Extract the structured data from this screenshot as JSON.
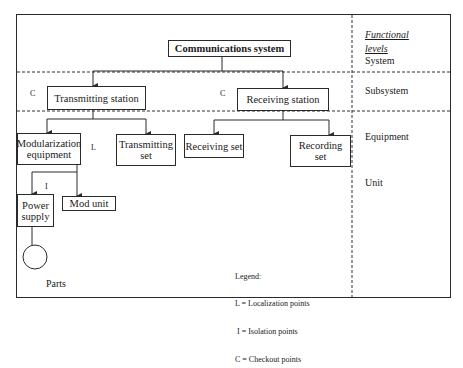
{
  "diagram": {
    "title": "Communications system",
    "levels_header": [
      "Functional",
      "levels"
    ],
    "levels": [
      "System",
      "Subsystem",
      "Equipment",
      "Unit"
    ],
    "nodes": {
      "system": "Communications system",
      "transmitting_station": "Transmitting station",
      "receiving_station": "Receiving station",
      "modularization_equipment": "Modularization equipment",
      "transmitting_set": "Transmitting set",
      "receiving_set": "Receiving set",
      "recording_set": "Recording set",
      "power_supply": "Power supply",
      "mod_unit": "Mod unit",
      "parts": "Parts"
    },
    "markers": {
      "transmitting_station": "C",
      "receiving_station": "C",
      "modularization_equipment": "L",
      "power_supply": "I"
    },
    "legend": {
      "title": "Legend:",
      "items": [
        "L = Localization points",
        " I = Isolation points",
        "C = Checkout points"
      ]
    },
    "edges": [
      [
        "system",
        "transmitting_station"
      ],
      [
        "system",
        "receiving_station"
      ],
      [
        "transmitting_station",
        "modularization_equipment"
      ],
      [
        "transmitting_station",
        "transmitting_set"
      ],
      [
        "receiving_station",
        "receiving_set"
      ],
      [
        "receiving_station",
        "recording_set"
      ],
      [
        "modularization_equipment",
        "power_supply"
      ],
      [
        "modularization_equipment",
        "mod_unit"
      ],
      [
        "power_supply",
        "parts"
      ]
    ]
  }
}
